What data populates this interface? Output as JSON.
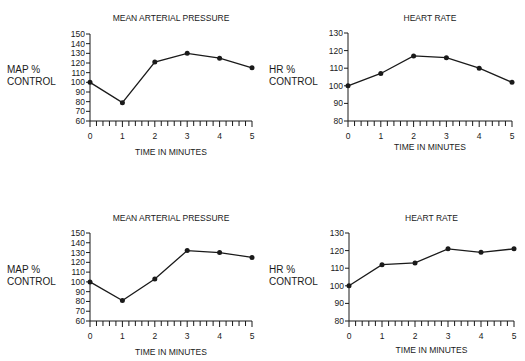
{
  "chart_data": [
    {
      "type": "line",
      "position": "top-left",
      "title": "MEAN ARTERIAL PRESSURE",
      "xlabel": "TIME IN MINUTES",
      "ylabel": [
        "MAP %",
        "CONTROL"
      ],
      "x": [
        0,
        1,
        2,
        3,
        4,
        5
      ],
      "values": [
        100,
        79,
        121,
        130,
        125,
        115
      ],
      "ylim": [
        60,
        150
      ],
      "yticks": [
        60,
        70,
        80,
        90,
        100,
        110,
        120,
        130,
        140,
        150
      ],
      "xticks": [
        0,
        1,
        2,
        3,
        4,
        5
      ],
      "grid": false
    },
    {
      "type": "line",
      "position": "top-right",
      "title": "HEART RATE",
      "xlabel": "TIME IN MINUTES",
      "ylabel": [
        "HR %",
        "CONTROL"
      ],
      "x": [
        0,
        1,
        2,
        3,
        4,
        5
      ],
      "values": [
        100,
        107,
        117,
        116,
        110,
        102
      ],
      "ylim": [
        80,
        130
      ],
      "yticks": [
        80,
        90,
        100,
        110,
        120,
        130
      ],
      "xticks": [
        0,
        1,
        2,
        3,
        4,
        5
      ],
      "grid": false
    },
    {
      "type": "line",
      "position": "bottom-left",
      "title": "MEAN ARTERIAL PRESSURE",
      "xlabel": "TIME IN MINUTES",
      "ylabel": [
        "MAP %",
        "CONTROL"
      ],
      "x": [
        0,
        1,
        2,
        3,
        4,
        5
      ],
      "values": [
        100,
        81,
        103,
        132,
        130,
        125
      ],
      "ylim": [
        60,
        150
      ],
      "yticks": [
        60,
        70,
        80,
        90,
        100,
        110,
        120,
        130,
        140,
        150
      ],
      "xticks": [
        0,
        1,
        2,
        3,
        4,
        5
      ],
      "grid": false
    },
    {
      "type": "line",
      "position": "bottom-right",
      "title": "HEART RATE",
      "xlabel": "TIME IN MINUTES",
      "ylabel": [
        "HR %",
        "CONTROL"
      ],
      "x": [
        0,
        1,
        2,
        3,
        4,
        5
      ],
      "values": [
        100,
        112,
        113,
        121,
        119,
        121
      ],
      "ylim": [
        80,
        130
      ],
      "yticks": [
        80,
        90,
        100,
        110,
        120,
        130
      ],
      "xticks": [
        0,
        1,
        2,
        3,
        4,
        5
      ],
      "grid": false
    }
  ],
  "colors": {
    "line": "#1a1a1a",
    "background": "#ffffff"
  }
}
